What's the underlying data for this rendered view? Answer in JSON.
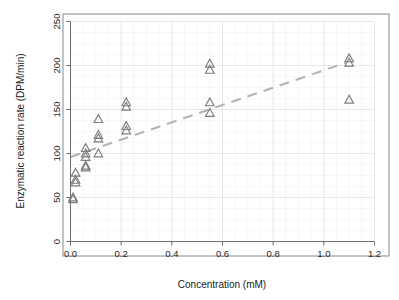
{
  "figure": {
    "background_color": "#ffffff",
    "frame_color": "#8a8a8a",
    "marker_color": "#7d7d7d",
    "trend_color": "#b4b4b4",
    "grid_major_color": "#e3e3e3",
    "grid_minor_color": "#f2f2f2"
  },
  "chart_data": {
    "type": "scatter",
    "title": "",
    "subtitle": "",
    "xlabel": "Concentration (mM)",
    "ylabel": "Enzymatic reaction rate (DPM/min)",
    "xlim": [
      0.0,
      1.2
    ],
    "ylim": [
      0,
      250
    ],
    "xticks": [
      0.0,
      0.2,
      0.4,
      0.6,
      0.8,
      1.0,
      1.2
    ],
    "xtick_labels": [
      "0.0",
      "0.2",
      "0.4",
      "0.6",
      "0.8",
      "1.0",
      "1.2"
    ],
    "yticks": [
      0,
      50,
      100,
      150,
      200,
      250
    ],
    "ytick_labels": [
      "0",
      "50",
      "100",
      "150",
      "200",
      "250"
    ],
    "grid": true,
    "grid_minor": true,
    "legend": null,
    "legend_position": "none",
    "marker": "triangle-up-open",
    "annotations": [],
    "series": [
      {
        "name": "Assay replicates",
        "marker": "triangle-up-open",
        "points": [
          {
            "x": 0.01,
            "y": 50
          },
          {
            "x": 0.01,
            "y": 48
          },
          {
            "x": 0.02,
            "y": 78
          },
          {
            "x": 0.02,
            "y": 70
          },
          {
            "x": 0.02,
            "y": 67
          },
          {
            "x": 0.06,
            "y": 106
          },
          {
            "x": 0.06,
            "y": 100
          },
          {
            "x": 0.06,
            "y": 96
          },
          {
            "x": 0.06,
            "y": 86
          },
          {
            "x": 0.06,
            "y": 84
          },
          {
            "x": 0.11,
            "y": 139
          },
          {
            "x": 0.11,
            "y": 121
          },
          {
            "x": 0.11,
            "y": 117
          },
          {
            "x": 0.11,
            "y": 100
          },
          {
            "x": 0.22,
            "y": 158
          },
          {
            "x": 0.22,
            "y": 153
          },
          {
            "x": 0.22,
            "y": 131
          },
          {
            "x": 0.22,
            "y": 126
          },
          {
            "x": 0.55,
            "y": 202
          },
          {
            "x": 0.55,
            "y": 195
          },
          {
            "x": 0.55,
            "y": 158
          },
          {
            "x": 0.55,
            "y": 146
          },
          {
            "x": 1.1,
            "y": 208
          },
          {
            "x": 1.1,
            "y": 203
          },
          {
            "x": 1.1,
            "y": 161
          }
        ]
      }
    ],
    "trend_line": {
      "name": "Fitted trend",
      "style": "dashed",
      "x_start": 0.0,
      "y_start": 96,
      "x_end": 1.085,
      "y_end": 203
    }
  }
}
